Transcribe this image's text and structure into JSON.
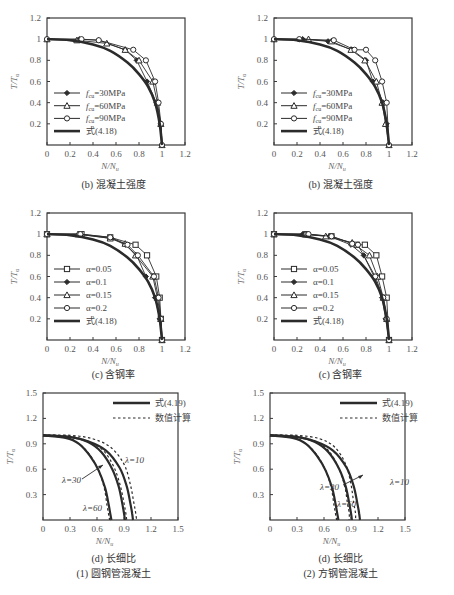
{
  "chart_data": [
    {
      "id": "b-left",
      "type": "line",
      "title": "(b) 混凝土强度",
      "xlabel": "N/Nu",
      "ylabel": "T/Tu",
      "xlim": [
        0,
        1.2
      ],
      "ylim": [
        0,
        1.2
      ],
      "xticks": [
        "0",
        "0.2",
        "0.4",
        "0.6",
        "0.8",
        "1",
        "1.2"
      ],
      "yticks": [
        "0.2",
        "0.4",
        "0.6",
        "0.8",
        "1",
        "1.2"
      ],
      "grid": false,
      "legend_position": "lower-left",
      "series": [
        {
          "name": "fcu=30MPa",
          "marker": "diamond",
          "x": [
            0,
            0.28,
            0.45,
            0.68,
            0.78,
            0.87,
            0.95,
            0.99,
            1.0
          ],
          "y": [
            1,
            1,
            0.99,
            0.9,
            0.8,
            0.6,
            0.4,
            0.2,
            0
          ]
        },
        {
          "name": "fcu=60MPa",
          "marker": "triangle",
          "x": [
            0,
            0.26,
            0.52,
            0.68,
            0.8,
            0.92,
            0.96,
            0.99,
            1.0
          ],
          "y": [
            1,
            0.99,
            0.96,
            0.9,
            0.8,
            0.6,
            0.4,
            0.2,
            0
          ]
        },
        {
          "name": "fcu=90MPa",
          "marker": "circle",
          "x": [
            0,
            0.3,
            0.45,
            0.75,
            0.86,
            0.94,
            0.97,
            0.99,
            1.0
          ],
          "y": [
            1,
            1,
            0.99,
            0.9,
            0.8,
            0.6,
            0.4,
            0.2,
            0
          ]
        },
        {
          "name": "式(4.18)",
          "marker": "none",
          "thick": true,
          "x": [
            0,
            0.2,
            0.4,
            0.55,
            0.7,
            0.8,
            0.88,
            0.94,
            0.98,
            1.0
          ],
          "y": [
            1,
            0.99,
            0.95,
            0.89,
            0.78,
            0.67,
            0.55,
            0.4,
            0.2,
            0
          ]
        }
      ]
    },
    {
      "id": "b-right",
      "type": "line",
      "title": "(b) 混凝土强度",
      "xlabel": "N/Nu",
      "ylabel": "T/Tu",
      "xlim": [
        0,
        1.2
      ],
      "ylim": [
        0,
        1.2
      ],
      "xticks": [
        "0",
        "0.2",
        "0.4",
        "0.6",
        "0.8",
        "1",
        "1.2"
      ],
      "yticks": [
        "0.2",
        "0.4",
        "0.6",
        "0.8",
        "1",
        "1.2"
      ],
      "grid": false,
      "legend_position": "lower-left",
      "series": [
        {
          "name": "fcu=30MPa",
          "marker": "diamond",
          "x": [
            0,
            0.25,
            0.47,
            0.68,
            0.8,
            0.86,
            0.95,
            0.98,
            1.0
          ],
          "y": [
            1,
            1,
            0.98,
            0.9,
            0.8,
            0.6,
            0.4,
            0.2,
            0
          ]
        },
        {
          "name": "fcu=60MPa",
          "marker": "triangle",
          "x": [
            0,
            0.3,
            0.5,
            0.67,
            0.79,
            0.89,
            0.94,
            0.97,
            1.0
          ],
          "y": [
            1,
            1,
            0.98,
            0.9,
            0.8,
            0.6,
            0.4,
            0.2,
            0
          ]
        },
        {
          "name": "fcu=90MPa",
          "marker": "circle",
          "x": [
            0,
            0.22,
            0.52,
            0.7,
            0.8,
            0.88,
            0.94,
            0.98,
            1.0
          ],
          "y": [
            1,
            1,
            0.99,
            0.9,
            0.9,
            0.8,
            0.6,
            0.4,
            0
          ]
        },
        {
          "name": "式(4.18)",
          "marker": "none",
          "thick": true,
          "x": [
            0,
            0.2,
            0.4,
            0.55,
            0.7,
            0.8,
            0.88,
            0.94,
            0.98,
            1.0
          ],
          "y": [
            1,
            0.99,
            0.95,
            0.89,
            0.78,
            0.67,
            0.55,
            0.4,
            0.2,
            0
          ]
        }
      ]
    },
    {
      "id": "c-left",
      "type": "line",
      "title": "(c) 含钢率",
      "xlabel": "N/Nu",
      "ylabel": "T/Tu",
      "xlim": [
        0,
        1.2
      ],
      "ylim": [
        0,
        1.2
      ],
      "xticks": [
        "0",
        "0.2",
        "0.4",
        "0.6",
        "0.8",
        "1",
        "1.2"
      ],
      "yticks": [
        "0.2",
        "0.4",
        "0.6",
        "0.8",
        "1",
        "1.2"
      ],
      "grid": false,
      "legend_position": "lower-left",
      "series": [
        {
          "name": "α=0.05",
          "marker": "square",
          "x": [
            0,
            0.3,
            0.55,
            0.77,
            0.87,
            0.95,
            0.98,
            0.99,
            1.0
          ],
          "y": [
            1,
            1,
            0.97,
            0.9,
            0.8,
            0.6,
            0.4,
            0.2,
            0
          ]
        },
        {
          "name": "α=0.1",
          "marker": "diamond",
          "x": [
            0,
            0.28,
            0.56,
            0.68,
            0.78,
            0.86,
            0.94,
            0.98,
            1.0
          ],
          "y": [
            1,
            1,
            0.96,
            0.9,
            0.8,
            0.6,
            0.4,
            0.2,
            0
          ]
        },
        {
          "name": "α=0.15",
          "marker": "triangle",
          "x": [
            0,
            0.27,
            0.55,
            0.68,
            0.77,
            0.92,
            0.96,
            0.99,
            1.0
          ],
          "y": [
            1,
            1,
            0.96,
            0.91,
            0.8,
            0.6,
            0.4,
            0.2,
            0
          ]
        },
        {
          "name": "α=0.2",
          "marker": "circle",
          "x": [
            0,
            0.29,
            0.55,
            0.7,
            0.79,
            0.93,
            0.97,
            0.99,
            1.0
          ],
          "y": [
            1,
            1,
            0.97,
            0.9,
            0.8,
            0.6,
            0.4,
            0.2,
            0
          ]
        },
        {
          "name": "式(4.18)",
          "marker": "none",
          "thick": true,
          "x": [
            0,
            0.2,
            0.4,
            0.55,
            0.7,
            0.8,
            0.88,
            0.94,
            0.98,
            1.0
          ],
          "y": [
            1,
            0.99,
            0.95,
            0.89,
            0.78,
            0.67,
            0.55,
            0.4,
            0.2,
            0
          ]
        }
      ]
    },
    {
      "id": "c-right",
      "type": "line",
      "title": "(c) 含钢率",
      "xlabel": "N/Nu",
      "ylabel": "T/Tu",
      "xlim": [
        0,
        1.2
      ],
      "ylim": [
        0,
        1.2
      ],
      "xticks": [
        "0",
        "0.2",
        "0.4",
        "0.6",
        "0.8",
        "1",
        "1.2"
      ],
      "yticks": [
        "0.2",
        "0.4",
        "0.6",
        "0.8",
        "1",
        "1.2"
      ],
      "grid": false,
      "legend_position": "lower-left",
      "series": [
        {
          "name": "α=0.05",
          "marker": "square",
          "x": [
            0,
            0.28,
            0.5,
            0.72,
            0.79,
            0.89,
            0.94,
            0.98,
            1.0
          ],
          "y": [
            1,
            1,
            0.98,
            0.9,
            0.9,
            0.8,
            0.6,
            0.4,
            0
          ]
        },
        {
          "name": "α=0.1",
          "marker": "diamond",
          "x": [
            0,
            0.25,
            0.48,
            0.67,
            0.78,
            0.87,
            0.94,
            0.97,
            1.0
          ],
          "y": [
            1,
            1,
            0.98,
            0.9,
            0.8,
            0.6,
            0.4,
            0.2,
            0
          ]
        },
        {
          "name": "α=0.15",
          "marker": "triangle",
          "x": [
            0,
            0.27,
            0.45,
            0.68,
            0.83,
            0.9,
            0.95,
            0.98,
            1.0
          ],
          "y": [
            1,
            1,
            0.98,
            0.92,
            0.8,
            0.6,
            0.4,
            0.2,
            0
          ]
        },
        {
          "name": "α=0.2",
          "marker": "circle",
          "x": [
            0,
            0.3,
            0.5,
            0.68,
            0.73,
            0.88,
            0.95,
            0.98,
            1.0
          ],
          "y": [
            1,
            1,
            0.98,
            0.91,
            0.9,
            0.6,
            0.4,
            0.2,
            0
          ]
        },
        {
          "name": "式(4.18)",
          "marker": "none",
          "thick": true,
          "x": [
            0,
            0.2,
            0.4,
            0.55,
            0.7,
            0.8,
            0.88,
            0.94,
            0.98,
            1.0
          ],
          "y": [
            1,
            0.99,
            0.95,
            0.89,
            0.78,
            0.67,
            0.55,
            0.4,
            0.2,
            0
          ]
        }
      ]
    },
    {
      "id": "d-left",
      "type": "line",
      "title": "(d) 长细比",
      "subtitle": "(1) 圆钢管混凝土",
      "xlabel": "N/Nu",
      "ylabel": "T/Tu",
      "xlim": [
        0,
        1.5
      ],
      "ylim": [
        0,
        1.5
      ],
      "xticks": [
        "0",
        "0.3",
        "0.6",
        "0.9",
        "1.2",
        "1.5"
      ],
      "yticks": [
        "0.3",
        "0.6",
        "0.9",
        "1.2",
        "1.5"
      ],
      "grid": false,
      "legend_position": "upper-right",
      "annotations": [
        "λ=10",
        "λ=30",
        "λ=60"
      ],
      "series": [
        {
          "name": "式(4.19) λ=10",
          "style": "solid",
          "x": [
            0,
            0.3,
            0.5,
            0.7,
            0.85,
            0.93,
            0.97,
            0.99,
            1.0
          ],
          "y": [
            1,
            0.98,
            0.93,
            0.82,
            0.62,
            0.4,
            0.2,
            0.08,
            0
          ]
        },
        {
          "name": "数值计算 λ=10",
          "style": "dashed",
          "x": [
            0,
            0.3,
            0.55,
            0.75,
            0.9,
            0.97,
            1.01,
            1.03,
            1.04
          ],
          "y": [
            1,
            1,
            0.96,
            0.86,
            0.66,
            0.42,
            0.2,
            0.08,
            0
          ]
        },
        {
          "name": "式(4.19) λ=30",
          "style": "solid",
          "x": [
            0,
            0.3,
            0.5,
            0.65,
            0.77,
            0.84,
            0.88,
            0.9,
            0.91
          ],
          "y": [
            1,
            0.98,
            0.92,
            0.8,
            0.6,
            0.4,
            0.2,
            0.08,
            0
          ]
        },
        {
          "name": "数值计算 λ=30",
          "style": "dashed",
          "x": [
            0,
            0.3,
            0.5,
            0.67,
            0.79,
            0.86,
            0.9,
            0.92,
            0.93
          ],
          "y": [
            1,
            0.99,
            0.93,
            0.82,
            0.62,
            0.4,
            0.2,
            0.08,
            0
          ]
        },
        {
          "name": "式(4.19) λ=60",
          "style": "solid",
          "x": [
            0,
            0.25,
            0.4,
            0.52,
            0.62,
            0.69,
            0.73,
            0.75,
            0.76
          ],
          "y": [
            1,
            0.97,
            0.9,
            0.76,
            0.58,
            0.38,
            0.18,
            0.06,
            0
          ]
        },
        {
          "name": "数值计算 λ=60",
          "style": "dashed",
          "x": [
            0,
            0.25,
            0.4,
            0.52,
            0.62,
            0.68,
            0.71,
            0.73,
            0.74
          ],
          "y": [
            1,
            0.98,
            0.9,
            0.77,
            0.58,
            0.38,
            0.18,
            0.06,
            0
          ]
        }
      ]
    },
    {
      "id": "d-right",
      "type": "line",
      "title": "(d) 长细比",
      "subtitle": "(2) 方钢管混凝土",
      "xlabel": "N/Nu",
      "ylabel": "T/Tu",
      "xlim": [
        0,
        1.5
      ],
      "ylim": [
        0,
        1.5
      ],
      "xticks": [
        "0",
        "0.3",
        "0.6",
        "0.9",
        "1.2",
        "1.5"
      ],
      "yticks": [
        "0.3",
        "0.6",
        "0.9",
        "1.2",
        "1.5"
      ],
      "grid": false,
      "legend_position": "upper-right",
      "annotations": [
        "λ=10",
        "λ=30",
        "λ=60"
      ],
      "series": [
        {
          "name": "式(4.19) λ=10",
          "style": "solid",
          "x": [
            0,
            0.3,
            0.5,
            0.7,
            0.85,
            0.93,
            0.97,
            0.99,
            1.0
          ],
          "y": [
            1,
            0.98,
            0.93,
            0.82,
            0.62,
            0.4,
            0.2,
            0.08,
            0
          ]
        },
        {
          "name": "数值计算 λ=10",
          "style": "dashed",
          "x": [
            0,
            0.3,
            0.55,
            0.72,
            0.84,
            0.9,
            0.93,
            0.95,
            0.95
          ],
          "y": [
            1,
            1,
            0.96,
            0.86,
            0.66,
            0.42,
            0.2,
            0.08,
            0
          ]
        },
        {
          "name": "式(4.19) λ=30",
          "style": "solid",
          "x": [
            0,
            0.3,
            0.5,
            0.65,
            0.77,
            0.84,
            0.88,
            0.9,
            0.91
          ],
          "y": [
            1,
            0.98,
            0.92,
            0.8,
            0.6,
            0.4,
            0.2,
            0.08,
            0
          ]
        },
        {
          "name": "数值计算 λ=30",
          "style": "dashed",
          "x": [
            0,
            0.3,
            0.5,
            0.65,
            0.76,
            0.83,
            0.86,
            0.88,
            0.88
          ],
          "y": [
            1,
            0.99,
            0.93,
            0.82,
            0.62,
            0.4,
            0.2,
            0.08,
            0
          ]
        },
        {
          "name": "式(4.19) λ=60",
          "style": "solid",
          "x": [
            0,
            0.25,
            0.4,
            0.52,
            0.62,
            0.69,
            0.73,
            0.75,
            0.76
          ],
          "y": [
            1,
            0.97,
            0.9,
            0.76,
            0.58,
            0.38,
            0.18,
            0.06,
            0
          ]
        },
        {
          "name": "数值计算 λ=60",
          "style": "dashed",
          "x": [
            0,
            0.25,
            0.4,
            0.52,
            0.62,
            0.68,
            0.71,
            0.73,
            0.74
          ],
          "y": [
            1,
            0.98,
            0.9,
            0.77,
            0.58,
            0.38,
            0.18,
            0.06,
            0
          ]
        }
      ]
    }
  ],
  "captions": {
    "b_left": "(b) 混凝土强度",
    "b_right": "(b) 混凝土强度",
    "c_left": "(c) 含钢率",
    "c_right": "(c) 含钢率",
    "d_left": "(d) 长细比",
    "d_right": "(d) 长细比",
    "d_left_sub": "(1) 圆钢管混凝土",
    "d_right_sub": "(2) 方钢管混凝土"
  },
  "axis_labels": {
    "x": "N/N",
    "x_sub": "u",
    "y": "T/T",
    "y_sub": "u"
  },
  "legend_b": [
    "=30MPa",
    "=60MPa",
    "=90MPa",
    "式(4.18)"
  ],
  "legend_b_prefix": "f",
  "legend_b_sub": "cu",
  "legend_c": [
    "α=0.05",
    "α=0.1",
    "α=0.15",
    "α=0.2",
    "式(4.18)"
  ],
  "legend_d": [
    "式(4.19)",
    "数值计算"
  ],
  "annotations_d": {
    "l10": "λ=10",
    "l30": "λ=30",
    "l60": "λ=60"
  },
  "colors": {
    "line": "#2b2b2b",
    "axis": "#3a3a3a",
    "text": "#555555",
    "background": "#ffffff"
  }
}
